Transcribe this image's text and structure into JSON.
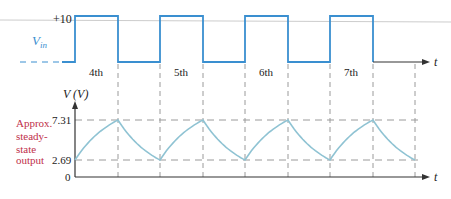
{
  "colors": {
    "pulse": "#3a8fd0",
    "baseline": "#2a4a6a",
    "output_curve": "#8fc3d3",
    "dashed_guides": "#9a9a9a",
    "axis": "#333333",
    "annotation_red": "#c0304a",
    "vin_label": "#3a8fd0"
  },
  "top_plot": {
    "vin_label": "V",
    "vin_sub": "in",
    "level_label": "+10",
    "t_label": "t",
    "pulse_labels": [
      "4th",
      "5th",
      "6th",
      "7th"
    ]
  },
  "bottom_plot": {
    "y_axis_label": "V (V)",
    "t_label": "t",
    "tick_labels": {
      "high": "7.31",
      "low": "2.69",
      "zero": "0"
    },
    "annotation_lines": [
      "Approx.",
      "steady-",
      "state",
      "output"
    ]
  },
  "chart_data": {
    "type": "line",
    "title": "",
    "series": [
      {
        "name": "Vin (square pulses)",
        "levels": [
          0,
          10
        ],
        "pulses": [
          "4th",
          "5th",
          "6th",
          "7th"
        ]
      },
      {
        "name": "Approx. steady-state output",
        "max": 7.31,
        "min": 2.69
      }
    ],
    "xlabel": "t",
    "ylabel": "V (V)",
    "yticks": [
      0,
      2.69,
      7.31
    ]
  }
}
